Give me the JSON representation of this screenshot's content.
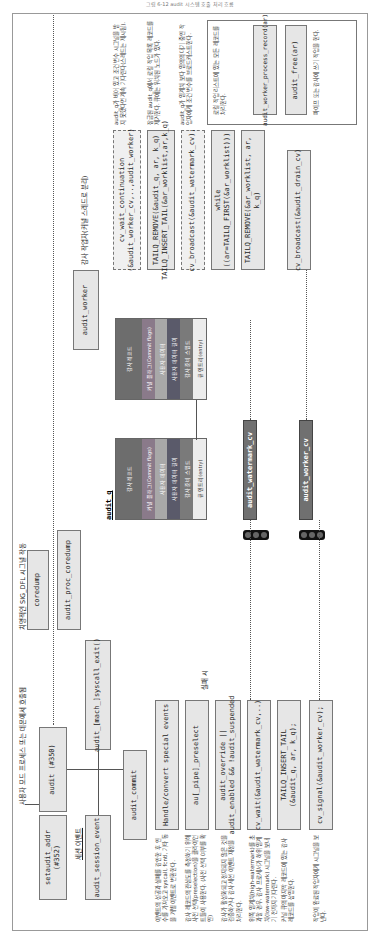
{
  "page": {
    "header": "그림 6-12 audit 시스템 호출 처리 흐름"
  },
  "diagram": {
    "entry_label": "사용자 모드 프로세스 또는 데몬에서 호출됨",
    "session_label": "세션 이벤트",
    "sigdfl_label": "치명적인 SIG_DFL 시그널 작동",
    "worker_label": "감사 작업자(커널 스레드로 분리)",
    "boxes": {
      "setaudit_addr": "setaudit_addr (#352)",
      "audit": "audit (#350)",
      "audit_session_event": "audit_session_event",
      "audit_mach_syscall_exit": "audit_[mach_]syscall_exit()",
      "coredump": "coredump",
      "audit_proc_coredump": "audit_proc_coredump",
      "audit_commit": "audit_commit",
      "handle_events": "Handle/convert special events",
      "au_pipe_preselect": "au[_pipe]_preselect",
      "audit_override": "audit_override ||\naudit_enabled && !audit_suspended",
      "cv_wait_watermark": "cv_wait(&audit_watermark_cv,..)",
      "tailq_insert_tail": "TAILQ_INSERT_TAIL\n(&audit_q, ar, k_q);",
      "cv_signal_worker": "cv_signal(&audit_worker_cv);",
      "audit_worker": "audit_worker",
      "cv_wait_continuation": "cv_wait_continuation\n(&audit_worker_cv,..,audit_worker)",
      "tailq_remove_insert": "TAILQ_REMOVE(&audit_q, ar, k_q)\nTAILQ_INSERT_TAIL(&ar_worklist,ar,k_q)",
      "cv_broadcast_watermark": "cv_broadcast(&audit_watermark_cv);",
      "while_loop": "while ((ar=TAILQ_FIRST(&ar_worklist)))",
      "tailq_remove_worklist": "TAILQ_REMOVE(&ar_worklist, ar, k_q)",
      "cv_broadcast_drain": "cv_broadcast(&audit_drain_cv)",
      "audit_worker_process_record": "audit_worker_process_record(ar)",
      "audit_free": "audit_free(ar)"
    },
    "fail_label": "실패 시",
    "audit_q_title": "audit_q",
    "audit_q_records": [
      [
        "감사 레코드",
        "커널 플래그(Commit flags)",
        "사용자 데이터",
        "사용자 데이터 길이",
        "감사 준비 스텝드",
        "큐 엔트리(entry)"
      ],
      [
        "감사 레코드",
        "커널 플래그(Commit flags)",
        "사용자 데이터",
        "사용자 데이터 길이",
        "감사 준비 스텝드",
        "큐 엔트리(entry)"
      ]
    ],
    "cv_boxes": {
      "watermark": "audit_watermark_cv",
      "worker": "audit_worker_cv"
    },
    "notes": {
      "handle": "이벤트의 성공과 실패를 감안한 후 인수를 가져오고 syscall, fcntl, 기타 동을 개별 이벤트로 변환한다.",
      "preselect": "감사 레코드의 관심도를 측정하기 위해 사전 선택(preselection)을 클라이언트들이 사용한다. (사전 선택 여부를 확인)",
      "override": "감사가 활성화되고 정지되지 않은 것을 검증하거나 감사 세션 이벤트 재정을 처리한다.",
      "watermark": "위쪽 임계치(high-watermark)를 초과할 경우, 감사 프로세서가 하위 임계치(low-watermark) 시그널을 보내기 전까지 기다린다.",
      "insert": "커널 큐의 마지막 레코드에 있는 감사 레코드를 삽입한다.",
      "signal": "작업이 완료된 작업자에게 시그널을 보낸다.",
      "continuation": "audit_q가 비어 있고 조건 변수 시그널을 받지 못했다면 계속 기다린다(스레드는 제시됨).",
      "remove_insert": "잠금된 audit_q에서 로컬 작업 목록 레코드를 제거한다. 큐에는 워치된 노드가 있다.",
      "broadcast_watermark": "audit_q가 임계치 보다 임의의 대기 중인 작업자에게 조건 변수를 브로드캐스트한다.",
      "while": "로컬 작업 리스트에 있는 모든 레코드를 처리한다.",
      "process": "파이프 또는 감사에 쓰기 작업을 한다."
    }
  }
}
